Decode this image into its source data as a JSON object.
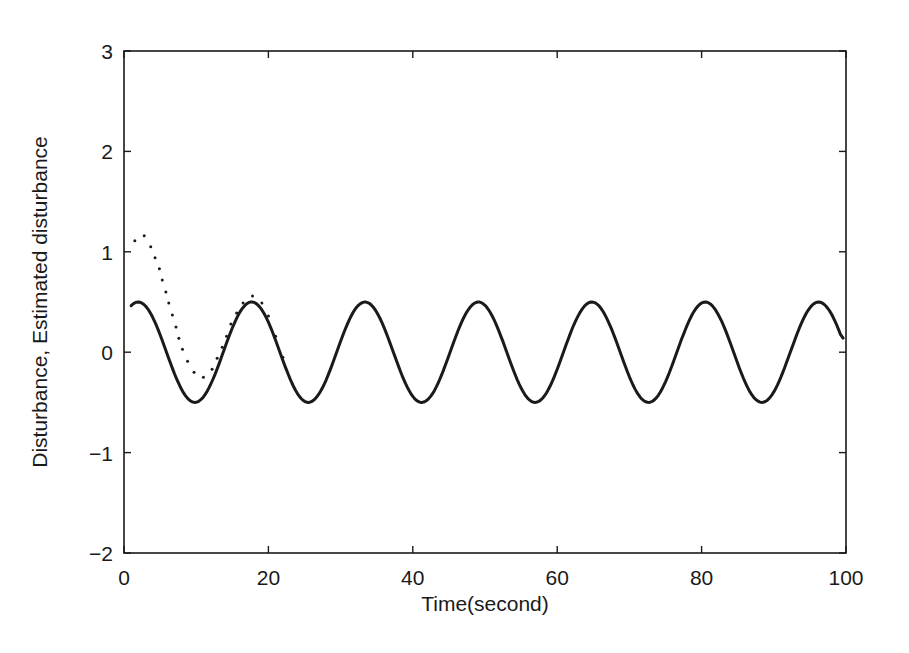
{
  "chart_data": {
    "type": "line",
    "title": "",
    "xlabel": "Time(second)",
    "ylabel": "Disturbance, Estimated disturbance",
    "xlim": [
      0,
      100
    ],
    "ylim": [
      -2,
      3
    ],
    "xticks": [
      0,
      20,
      40,
      60,
      80,
      100
    ],
    "xtick_labels": [
      "0",
      "20",
      "40",
      "60",
      "80",
      "100"
    ],
    "yticks": [
      -2,
      -1,
      0,
      1,
      2,
      3
    ],
    "ytick_labels": [
      "−2",
      "−1",
      "0",
      "1",
      "2",
      "3"
    ],
    "grid": false,
    "legend": null,
    "series": [
      {
        "name": "Disturbance",
        "style": "solid",
        "color": "#1a1a1a",
        "description": "sinusoid approx 0.5*sin(0.4*t + pi/4), amplitude 0.5, period ~15.7 s",
        "x": [
          1,
          2,
          3,
          4,
          5,
          6,
          7,
          8,
          9,
          10,
          11,
          12,
          13,
          14,
          15,
          16,
          17,
          18,
          19,
          20,
          21,
          22,
          23,
          24,
          25,
          26,
          27,
          28,
          29,
          30,
          31,
          32,
          33,
          34,
          35,
          36,
          37,
          38,
          39,
          40,
          41,
          42,
          43,
          44,
          45,
          46,
          47,
          48,
          49,
          50,
          51,
          52,
          53,
          54,
          55,
          56,
          57,
          58,
          59,
          60,
          61,
          62,
          63,
          64,
          65,
          66,
          67,
          68,
          69,
          70,
          71,
          72,
          73,
          74,
          75,
          76,
          77,
          78,
          79,
          80,
          81,
          82,
          83,
          84,
          85,
          86,
          87,
          88,
          89,
          90,
          91,
          92,
          93,
          94,
          95,
          96,
          97,
          98,
          99,
          100
        ],
        "values": [
          0.42,
          0.5,
          0.47,
          0.35,
          0.17,
          -0.04,
          -0.24,
          -0.4,
          -0.49,
          -0.49,
          -0.41,
          -0.26,
          -0.07,
          0.14,
          0.33,
          0.46,
          0.5,
          0.45,
          0.32,
          0.14,
          -0.07,
          -0.27,
          -0.42,
          -0.5,
          -0.48,
          -0.38,
          -0.22,
          -0.02,
          0.18,
          0.36,
          0.48,
          0.49,
          0.42,
          0.27,
          0.08,
          -0.13,
          -0.31,
          -0.45,
          -0.5,
          -0.46,
          -0.34,
          -0.16,
          0.04,
          0.24,
          0.4,
          0.49,
          0.49,
          0.4,
          0.25,
          0.06,
          -0.15,
          -0.34,
          -0.46,
          -0.5,
          -0.44,
          -0.3,
          -0.11,
          0.09,
          0.29,
          0.43,
          0.5,
          0.47,
          0.36,
          0.19,
          -0.02,
          -0.22,
          -0.39,
          -0.49,
          -0.49,
          -0.41,
          -0.27,
          -0.07,
          0.13,
          0.32,
          0.45,
          0.5,
          0.45,
          0.33,
          0.15,
          -0.06,
          -0.26,
          -0.42,
          -0.5,
          -0.48,
          -0.38,
          -0.22,
          -0.02,
          0.18,
          0.36,
          0.48,
          0.49,
          0.42,
          0.27,
          0.08,
          -0.13,
          -0.31,
          -0.45,
          -0.5,
          -0.46,
          0.14
        ]
      },
      {
        "name": "Estimated disturbance",
        "style": "dotted",
        "color": "#1a1a1a",
        "description": "starts near 1.1, dips to about -0.25 near t=11, overshoots to ~0.56 near t=18, then converges to the disturbance by t~22",
        "x": [
          1.5,
          2.8,
          3.7,
          4.3,
          4.9,
          5.3,
          5.8,
          6.2,
          6.7,
          7.2,
          7.6,
          8.1,
          8.8,
          9.7,
          11.0,
          12.2,
          12.9,
          13.6,
          14.2,
          14.8,
          15.6,
          16.5,
          17.8,
          19.1,
          20.0,
          21.0,
          22.0
        ],
        "values": [
          1.11,
          1.16,
          1.05,
          0.94,
          0.83,
          0.72,
          0.6,
          0.49,
          0.37,
          0.25,
          0.14,
          0.03,
          -0.09,
          -0.2,
          -0.25,
          -0.17,
          -0.06,
          0.05,
          0.16,
          0.28,
          0.39,
          0.49,
          0.56,
          0.49,
          0.36,
          0.16,
          -0.05
        ]
      }
    ]
  },
  "plot_box": {
    "left": 124,
    "top": 51,
    "right": 846,
    "bottom": 553
  }
}
